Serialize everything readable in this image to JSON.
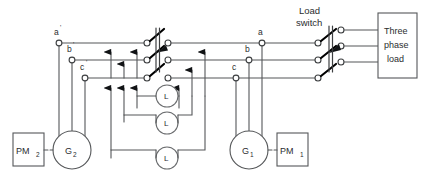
{
  "diagram": {
    "title_text": "",
    "colors": {
      "wire": "#555759",
      "blade": "#000000",
      "text": "#2b2d2f",
      "background": "#ffffff",
      "terminal_fill": "#ffffff"
    },
    "labels": {
      "load_switch_line1": "Load",
      "load_switch_line2": "switch",
      "load_line1": "Three",
      "load_line2": "phase",
      "load_line3": "load"
    },
    "left_terminals": [
      {
        "name": "a-prime",
        "base": "a",
        "prime": "'"
      },
      {
        "name": "b-prime",
        "base": "b",
        "prime": "'"
      },
      {
        "name": "c-prime",
        "base": "c",
        "prime": "'"
      }
    ],
    "right_terminals": [
      {
        "name": "a",
        "base": "a",
        "prime": ""
      },
      {
        "name": "b",
        "base": "b",
        "prime": ""
      },
      {
        "name": "c",
        "base": "c",
        "prime": ""
      }
    ],
    "generators": [
      {
        "name": "generator-2",
        "base": "G",
        "sub": "2"
      },
      {
        "name": "generator-1",
        "base": "G",
        "sub": "1"
      }
    ],
    "prime_movers": [
      {
        "name": "prime-mover-2",
        "base": "PM",
        "sub": "2"
      },
      {
        "name": "prime-mover-1",
        "base": "PM",
        "sub": "1"
      }
    ],
    "lamps": [
      {
        "name": "lamp-1",
        "label": "L"
      },
      {
        "name": "lamp-2",
        "label": "L"
      },
      {
        "name": "lamp-3",
        "label": "L"
      }
    ],
    "switches": {
      "synchronizing_switch": {
        "name": "synchronizing-switch",
        "poles": 3,
        "state": "open"
      },
      "load_switch": {
        "name": "load-switch",
        "poles": 3,
        "state": "open"
      }
    },
    "phase_rows": {
      "a_y": 43,
      "b_y": 60,
      "c_y": 78
    }
  }
}
